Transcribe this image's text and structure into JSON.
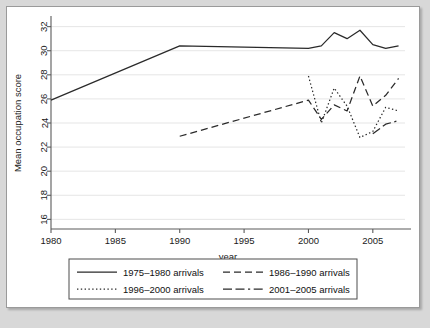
{
  "chart_data": {
    "type": "line",
    "title": "",
    "xlabel": "year",
    "ylabel": "Mean occupation score",
    "xlim": [
      1980,
      2007.5
    ],
    "ylim": [
      15.2,
      32.8
    ],
    "xticks": [
      1980,
      1985,
      1990,
      1995,
      2000,
      2005
    ],
    "yticks": [
      16,
      18,
      20,
      22,
      24,
      26,
      28,
      30,
      32
    ],
    "grid": "horizontal",
    "legend_position": "bottom",
    "series": [
      {
        "name": "1975–1980 arrivals",
        "dash": "solid",
        "x": [
          1980,
          1990,
          2000,
          2001,
          2002,
          2003,
          2004,
          2005,
          2006,
          2007
        ],
        "values": [
          25.9,
          30.4,
          30.2,
          30.4,
          31.5,
          31.0,
          31.7,
          30.5,
          30.2,
          30.4
        ]
      },
      {
        "name": "1986–1990 arrivals",
        "dash": "dashed",
        "x": [
          1990,
          2000,
          2001,
          2002,
          2003,
          2004,
          2005,
          2006,
          2007
        ],
        "values": [
          22.9,
          25.9,
          24.3,
          25.5,
          25.0,
          27.9,
          25.4,
          26.3,
          27.7
        ]
      },
      {
        "name": "1996–2000 arrivals",
        "dash": "dotted",
        "x": [
          2000,
          2001,
          2002,
          2003,
          2004,
          2005,
          2006,
          2007
        ],
        "values": [
          27.9,
          24.0,
          26.9,
          25.4,
          22.8,
          23.3,
          25.3,
          25.0
        ]
      },
      {
        "name": "2001–2005 arrivals",
        "dash": "dashdot",
        "x": [
          2005,
          2006,
          2007
        ],
        "values": [
          23.1,
          23.9,
          24.2
        ]
      }
    ],
    "legend_entries": [
      "1975–1980 arrivals",
      "1986–1990 arrivals",
      "1996–2000 arrivals",
      "2001–2005 arrivals"
    ]
  }
}
